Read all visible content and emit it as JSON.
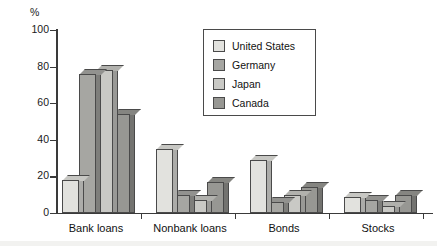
{
  "chart_data": {
    "type": "bar",
    "title": "",
    "xlabel": "",
    "ylabel": "%",
    "ylim": [
      0,
      100
    ],
    "yticks": [
      0,
      20,
      40,
      60,
      80,
      100
    ],
    "grid": false,
    "legend_position": "upper-center",
    "categories": [
      "Bank loans",
      "Nonbank loans",
      "Bonds",
      "Stocks"
    ],
    "series": [
      {
        "name": "United States",
        "color": "#e2e2de",
        "values": [
          18,
          35,
          29,
          9
        ]
      },
      {
        "name": "Germany",
        "color": "#a6a6a2",
        "values": [
          76,
          10,
          6,
          7
        ]
      },
      {
        "name": "Japan",
        "color": "#c9c9c5",
        "values": [
          78,
          7,
          10,
          4
        ]
      },
      {
        "name": "Canada",
        "color": "#979793",
        "values": [
          54,
          17,
          14,
          10
        ]
      }
    ]
  },
  "axis": {
    "unit_label": "%",
    "tick_labels": [
      "100",
      "80",
      "60",
      "40",
      "20",
      "0"
    ]
  },
  "legend": {
    "entries": [
      {
        "label": "United States"
      },
      {
        "label": "Germany"
      },
      {
        "label": "Japan"
      },
      {
        "label": "Canada"
      }
    ]
  }
}
